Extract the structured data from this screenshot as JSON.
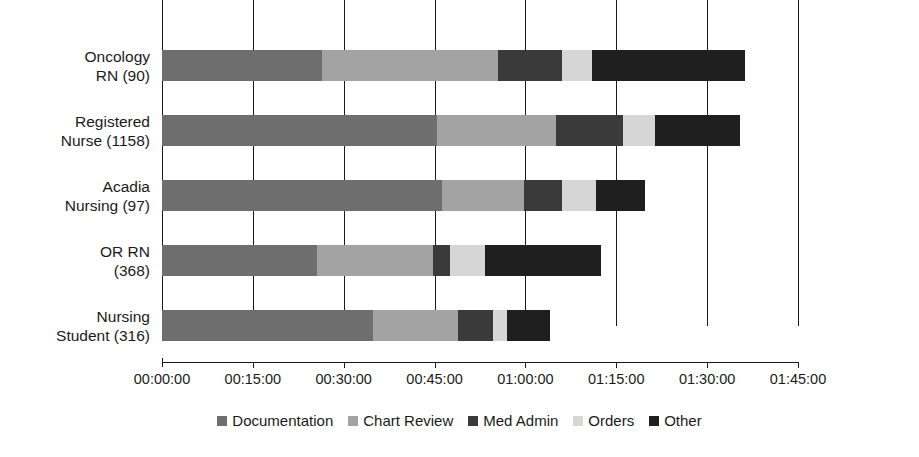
{
  "chart_data": {
    "type": "bar",
    "orientation": "horizontal",
    "stacked": true,
    "title": "",
    "xlabel": "",
    "ylabel": "",
    "grid": true,
    "grid_axis": "x",
    "legend_position": "bottom",
    "x_unit": "duration (hh:mm:ss)",
    "xlim": [
      "00:00:00",
      "01:45:00"
    ],
    "xticks": [
      "00:00:00",
      "00:15:00",
      "00:30:00",
      "00:45:00",
      "01:00:00",
      "01:15:00",
      "01:30:00",
      "01:45:00"
    ],
    "xtick_minutes": [
      0,
      15,
      30,
      45,
      60,
      75,
      90,
      105
    ],
    "categories": [
      {
        "label_lines": [
          "Oncology",
          "RN (90)"
        ],
        "name": "Oncology RN",
        "count": 90
      },
      {
        "label_lines": [
          "Registered",
          "Nurse (1158)"
        ],
        "name": "Registered Nurse",
        "count": 1158
      },
      {
        "label_lines": [
          "Acadia",
          "Nursing (97)"
        ],
        "name": "Acadia Nursing",
        "count": 97
      },
      {
        "label_lines": [
          "OR RN",
          "(368)"
        ],
        "name": "OR RN",
        "count": 368
      },
      {
        "label_lines": [
          "Nursing",
          "Student (316)"
        ],
        "name": "Nursing Student",
        "count": 316
      }
    ],
    "series": [
      {
        "name": "Documentation",
        "color": "#6e6e6e",
        "values_minutes": [
          26.4,
          45.4,
          46.2,
          25.6,
          34.8
        ]
      },
      {
        "name": "Chart Review",
        "color": "#a3a3a3",
        "values_minutes": [
          29.0,
          19.6,
          13.5,
          19.1,
          14.0
        ]
      },
      {
        "name": "Med Admin",
        "color": "#3a3a3a",
        "values_minutes": [
          10.6,
          11.1,
          6.3,
          2.8,
          5.9
        ]
      },
      {
        "name": "Orders",
        "color": "#d6d6d6",
        "values_minutes": [
          5.0,
          5.3,
          5.6,
          5.8,
          2.3
        ]
      },
      {
        "name": "Other",
        "color": "#1f1f1f",
        "values_minutes": [
          25.2,
          14.0,
          8.1,
          19.1,
          7.1
        ]
      }
    ],
    "totals_minutes": [
      96.2,
      95.4,
      79.7,
      72.4,
      64.2
    ]
  },
  "legend": {
    "items": [
      {
        "label": "Documentation",
        "color": "#6e6e6e"
      },
      {
        "label": "Chart Review",
        "color": "#a3a3a3"
      },
      {
        "label": "Med Admin",
        "color": "#3a3a3a"
      },
      {
        "label": "Orders",
        "color": "#d6d6d6"
      },
      {
        "label": "Other",
        "color": "#1f1f1f"
      }
    ]
  },
  "axis": {
    "line_color": "#1a1a1a",
    "grid_color": "#1a1a1a"
  }
}
